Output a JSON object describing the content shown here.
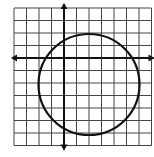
{
  "diagram": {
    "type": "coordinate-grid-with-circle",
    "grid": {
      "x_min": -4,
      "x_max": 7,
      "y_min": -7,
      "y_max": 4,
      "cell_px": 12.5,
      "origin_px": [
        14,
        8
      ],
      "line_color": "#444444",
      "background": "#ffffff"
    },
    "axes": {
      "x_axis_y": 0,
      "y_axis_x": 0,
      "color": "#111111",
      "arrows": true
    },
    "circle": {
      "center": [
        2,
        -2
      ],
      "radius": 4,
      "color": "#111111"
    }
  }
}
